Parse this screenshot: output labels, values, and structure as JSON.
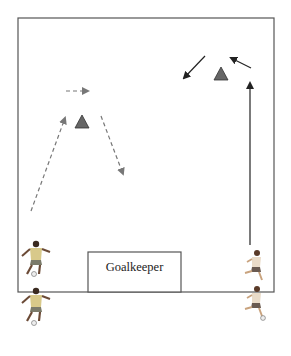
{
  "diagram": {
    "type": "soccer-drill",
    "field": {
      "x": 18,
      "y": 18,
      "width": 256,
      "height": 274,
      "stroke": "#555555"
    },
    "goal_box": {
      "x": 88,
      "y": 252,
      "width": 93,
      "height": 40,
      "label": "Goalkeeper"
    },
    "cones": [
      {
        "id": "cone-left",
        "x": 82,
        "y": 122,
        "color": "#666666"
      },
      {
        "id": "cone-right",
        "x": 221,
        "y": 73,
        "color": "#666666"
      }
    ],
    "arrows": [
      {
        "id": "pass-up-left",
        "style": "dashed",
        "color": "#777777",
        "from": [
          31,
          211
        ],
        "to": [
          66,
          116
        ]
      },
      {
        "id": "dribble-right",
        "style": "dashed",
        "color": "#777777",
        "from": [
          66,
          91
        ],
        "to": [
          89,
          91
        ]
      },
      {
        "id": "pass-down-right",
        "style": "dashed",
        "color": "#777777",
        "from": [
          101,
          116
        ],
        "to": [
          124,
          176
        ]
      },
      {
        "id": "run-up-right",
        "style": "solid",
        "color": "#222222",
        "from": [
          250,
          245
        ],
        "to": [
          250,
          80
        ]
      },
      {
        "id": "run-up-left",
        "style": "solid",
        "color": "#222222",
        "from": [
          251,
          68
        ],
        "to": [
          229,
          57
        ]
      },
      {
        "id": "run-down-left",
        "style": "solid",
        "color": "#222222",
        "from": [
          205,
          56
        ],
        "to": [
          183,
          80
        ]
      }
    ],
    "players": [
      {
        "id": "player-left-1",
        "x": 36,
        "y": 260,
        "team": "yellow"
      },
      {
        "id": "player-left-2",
        "x": 36,
        "y": 307,
        "team": "yellow"
      },
      {
        "id": "player-right-1",
        "x": 256,
        "y": 268,
        "team": "white"
      },
      {
        "id": "player-right-2",
        "x": 256,
        "y": 304,
        "team": "white"
      }
    ]
  }
}
